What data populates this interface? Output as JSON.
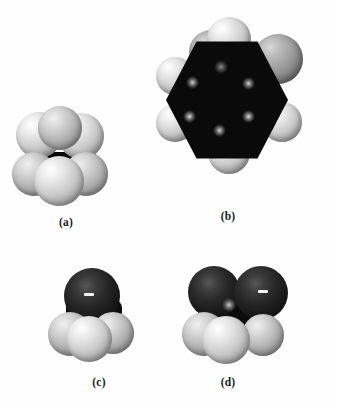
{
  "figure": {
    "background_color": "#fefefe",
    "panels": [
      {
        "id": "a",
        "caption": "(a)",
        "molecule": "ethane",
        "description": "Space-filling model of ethane: two carbon atoms hidden behind six light hydrogen spheres, viewed along the C-C axis in eclipsed orientation.",
        "atom_colors": {
          "hydrogen": "#d8d8d8",
          "carbon": "#101010"
        },
        "atom_counts": {
          "hydrogen": 6,
          "carbon": 2
        }
      },
      {
        "id": "b",
        "caption": "(b)",
        "molecule": "benzene",
        "description": "Space-filling model of benzene: flat hexagonal dark carbon ring with six hydrogen spheres around the perimeter.",
        "atom_colors": {
          "hydrogen": "#d4d4d4",
          "carbon": "#0a0a0a",
          "shaded_hydrogen": "#9a9a9a"
        },
        "atom_counts": {
          "hydrogen": 6,
          "carbon": 6
        }
      },
      {
        "id": "c",
        "caption": "(c)",
        "molecule": "methyl group with dark heteroatom",
        "description": "Space-filling model with a single large dark sphere on top bearing a white specular dash and three light hydrogen spheres below.",
        "atom_colors": {
          "hydrogen": "#dcdcdc",
          "dark_atom": "#1c1c1c"
        },
        "atom_counts": {
          "hydrogen": 3,
          "dark_atom": 1
        }
      },
      {
        "id": "d",
        "caption": "(d)",
        "molecule": "two dark atoms with methyl hydrogens",
        "description": "Space-filling model with two dark spheres on top, the right one bearing a white specular dash, a dark core, and three light hydrogen spheres below.",
        "atom_colors": {
          "hydrogen": "#dcdcdc",
          "dark_atom": "#1c1c1c"
        },
        "atom_counts": {
          "hydrogen": 3,
          "dark_atom": 2
        }
      }
    ]
  }
}
